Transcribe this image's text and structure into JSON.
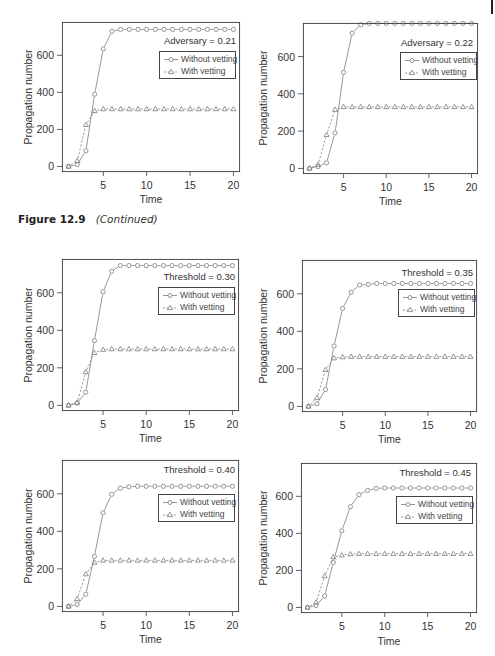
{
  "figure": {
    "label": "Figure 12.9",
    "note": "(Continued)"
  },
  "colors": {
    "series_line": "#7d7d7d",
    "marker": "#7a7a7a",
    "frame": "#3a3a3a",
    "tick": "#3a3a3a"
  },
  "chart_data": [
    {
      "type": "line",
      "annotation": "Adversary = 0.21",
      "xlabel": "Time",
      "ylabel": "Propagation number",
      "x": [
        1,
        2,
        3,
        4,
        5,
        6,
        7,
        8,
        9,
        10,
        11,
        12,
        13,
        14,
        15,
        16,
        17,
        18,
        19,
        20
      ],
      "xticks": [
        5,
        10,
        15,
        20
      ],
      "yticks": [
        0,
        200,
        400,
        600
      ],
      "xlim": [
        0.24,
        20.76
      ],
      "ylim": [
        -30,
        780
      ],
      "legend": {
        "position": "upper right"
      },
      "series": [
        {
          "name": "Without vetting",
          "marker": "circle",
          "linestyle": "solid",
          "values": [
            0,
            10,
            85,
            390,
            635,
            730,
            740,
            740,
            740,
            740,
            740,
            740,
            740,
            740,
            740,
            740,
            740,
            740,
            740,
            740
          ]
        },
        {
          "name": "With vetting",
          "marker": "triangle",
          "linestyle": "dashed",
          "values": [
            0,
            30,
            225,
            300,
            310,
            310,
            310,
            310,
            310,
            310,
            310,
            310,
            310,
            310,
            310,
            310,
            310,
            310,
            310,
            310
          ]
        }
      ]
    },
    {
      "type": "line",
      "annotation": "Adversary = 0.22",
      "xlabel": "Time",
      "ylabel": "Propagation number",
      "x": [
        1,
        2,
        3,
        4,
        5,
        6,
        7,
        8,
        9,
        10,
        11,
        12,
        13,
        14,
        15,
        16,
        17,
        18,
        19,
        20
      ],
      "xticks": [
        5,
        10,
        15,
        20
      ],
      "yticks": [
        0,
        200,
        400,
        600
      ],
      "xlim": [
        0.24,
        20.76
      ],
      "ylim": [
        -30,
        780
      ],
      "legend": {
        "position": "upper right"
      },
      "series": [
        {
          "name": "Without vetting",
          "marker": "circle",
          "linestyle": "solid",
          "values": [
            0,
            10,
            30,
            190,
            515,
            725,
            770,
            778,
            778,
            778,
            778,
            778,
            778,
            778,
            778,
            778,
            778,
            778,
            778,
            778
          ]
        },
        {
          "name": "With vetting",
          "marker": "triangle",
          "linestyle": "dashed",
          "values": [
            0,
            20,
            180,
            315,
            330,
            330,
            330,
            330,
            330,
            330,
            330,
            330,
            330,
            330,
            330,
            330,
            330,
            330,
            330,
            330
          ]
        }
      ]
    },
    {
      "type": "line",
      "annotation": "Threshold = 0.30",
      "xlabel": "Time",
      "ylabel": "Propagation number",
      "x": [
        1,
        2,
        3,
        4,
        5,
        6,
        7,
        8,
        9,
        10,
        11,
        12,
        13,
        14,
        15,
        16,
        17,
        18,
        19,
        20
      ],
      "xticks": [
        5,
        10,
        15,
        20
      ],
      "yticks": [
        0,
        200,
        400,
        600
      ],
      "xlim": [
        0.24,
        20.76
      ],
      "ylim": [
        -30,
        780
      ],
      "legend": {
        "position": "upper right"
      },
      "series": [
        {
          "name": "Without vetting",
          "marker": "circle",
          "linestyle": "solid",
          "values": [
            0,
            12,
            70,
            345,
            605,
            715,
            745,
            745,
            745,
            745,
            745,
            745,
            745,
            745,
            745,
            745,
            745,
            745,
            745,
            745
          ]
        },
        {
          "name": "With vetting",
          "marker": "triangle",
          "linestyle": "dashed",
          "values": [
            0,
            15,
            178,
            280,
            297,
            300,
            300,
            300,
            300,
            300,
            300,
            300,
            300,
            300,
            300,
            300,
            300,
            300,
            300,
            300
          ]
        }
      ]
    },
    {
      "type": "line",
      "annotation": "Threshold = 0.35",
      "xlabel": "Time",
      "ylabel": "Propagation number",
      "x": [
        1,
        2,
        3,
        4,
        5,
        6,
        7,
        8,
        9,
        10,
        11,
        12,
        13,
        14,
        15,
        16,
        17,
        18,
        19,
        20
      ],
      "xticks": [
        5,
        10,
        15,
        20
      ],
      "yticks": [
        0,
        200,
        400,
        600
      ],
      "xlim": [
        0.24,
        20.76
      ],
      "ylim": [
        -30,
        780
      ],
      "legend": {
        "position": "upper right"
      },
      "series": [
        {
          "name": "Without vetting",
          "marker": "circle",
          "linestyle": "solid",
          "values": [
            0,
            14,
            90,
            322,
            522,
            608,
            647,
            650,
            655,
            655,
            655,
            655,
            655,
            655,
            655,
            655,
            655,
            655,
            655,
            655
          ]
        },
        {
          "name": "With vetting",
          "marker": "triangle",
          "linestyle": "dashed",
          "values": [
            0,
            46,
            195,
            257,
            263,
            265,
            265,
            265,
            265,
            265,
            265,
            265,
            265,
            265,
            265,
            265,
            265,
            265,
            265,
            265
          ]
        }
      ]
    },
    {
      "type": "line",
      "annotation": "Threshold = 0.40",
      "xlabel": "Time",
      "ylabel": "Propagation number",
      "x": [
        1,
        2,
        3,
        4,
        5,
        6,
        7,
        8,
        9,
        10,
        11,
        12,
        13,
        14,
        15,
        16,
        17,
        18,
        19,
        20
      ],
      "xticks": [
        5,
        10,
        15,
        20
      ],
      "yticks": [
        0,
        200,
        400,
        600
      ],
      "xlim": [
        0.24,
        20.76
      ],
      "ylim": [
        -30,
        780
      ],
      "legend": {
        "position": "upper right"
      },
      "series": [
        {
          "name": "Without vetting",
          "marker": "circle",
          "linestyle": "solid",
          "values": [
            0,
            10,
            65,
            266,
            498,
            597,
            630,
            637,
            640,
            640,
            640,
            640,
            640,
            640,
            640,
            640,
            640,
            640,
            640,
            640
          ]
        },
        {
          "name": "With vetting",
          "marker": "triangle",
          "linestyle": "dashed",
          "values": [
            0,
            40,
            172,
            234,
            245,
            245,
            245,
            245,
            245,
            245,
            245,
            245,
            245,
            245,
            245,
            245,
            245,
            245,
            245,
            245
          ]
        }
      ]
    },
    {
      "type": "line",
      "annotation": "Threshold = 0.45",
      "xlabel": "Time",
      "ylabel": "Propagation number",
      "x": [
        1,
        2,
        3,
        4,
        5,
        6,
        7,
        8,
        9,
        10,
        11,
        12,
        13,
        14,
        15,
        16,
        17,
        18,
        19,
        20
      ],
      "xticks": [
        5,
        10,
        15,
        20
      ],
      "yticks": [
        0,
        200,
        400,
        600
      ],
      "xlim": [
        0.24,
        20.76
      ],
      "ylim": [
        -30,
        780
      ],
      "legend": {
        "position": "upper right"
      },
      "series": [
        {
          "name": "Without vetting",
          "marker": "circle",
          "linestyle": "solid",
          "values": [
            0,
            10,
            62,
            243,
            414,
            544,
            609,
            632,
            643,
            645,
            645,
            645,
            645,
            645,
            645,
            645,
            645,
            645,
            645,
            645
          ]
        },
        {
          "name": "With vetting",
          "marker": "triangle",
          "linestyle": "dashed",
          "values": [
            0,
            27,
            170,
            272,
            282,
            288,
            290,
            290,
            290,
            290,
            290,
            290,
            290,
            290,
            290,
            290,
            290,
            290,
            290,
            290
          ]
        }
      ]
    }
  ]
}
